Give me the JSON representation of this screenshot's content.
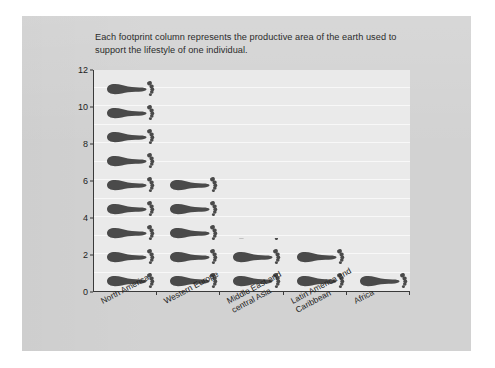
{
  "caption": {
    "text": "Each footprint column represents the productive area of the earth used to support the lifestyle of one individual."
  },
  "chart_data": {
    "type": "bar",
    "title": "Each footprint column represents the productive area of the earth used to support the lifestyle of one individual.",
    "xlabel": "",
    "ylabel": "Area units per person",
    "ylim": [
      0,
      12
    ],
    "yticks": [
      "0",
      "2",
      "4",
      "6",
      "8",
      "10",
      "12"
    ],
    "grid": true,
    "legend": "none",
    "glyph": "footprint",
    "units_per_glyph": 1.3,
    "categories": [
      "North America",
      "Western Europe",
      "Middle East and central Asia",
      "Latin America and Caribbean",
      "Africa"
    ],
    "category_lines": [
      [
        "North America"
      ],
      [
        "Western Europe"
      ],
      [
        "Middle East and",
        "central Asia"
      ],
      [
        "Latin America and",
        "Caribbean"
      ],
      [
        "Africa"
      ]
    ],
    "values": [
      11.6,
      6.4,
      2.9,
      2.5,
      1.3
    ],
    "glyph_counts": [
      9,
      5,
      3,
      2,
      1
    ],
    "series": [
      {
        "name": "Area units per person",
        "values": [
          11.6,
          6.4,
          2.9,
          2.5,
          1.3
        ]
      }
    ]
  },
  "colors": {
    "slide_background": "#d2d2d2",
    "plot_background": "#eaeaea",
    "gridline": "#f8f8f8",
    "axis": "#3a3a3a",
    "footprint": "#4a4a4a",
    "text": "#222222",
    "page_background": "#ffffff"
  }
}
